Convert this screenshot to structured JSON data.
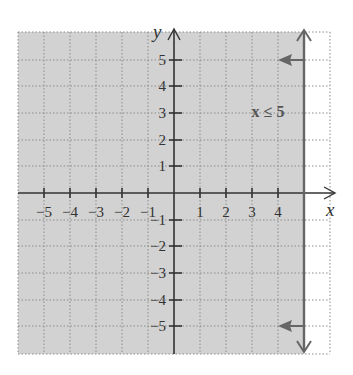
{
  "figure": {
    "type": "coordinate-plane-inequality-graph",
    "inequality_label": "x ≤ 5",
    "x_axis_label": "x",
    "y_axis_label": "y",
    "x_tick_labels": [
      "−5",
      "−4",
      "−3",
      "−2",
      "−1",
      "1",
      "2",
      "3",
      "4"
    ],
    "y_tick_labels": [
      "5",
      "4",
      "3",
      "2",
      "1",
      "−1",
      "−2",
      "−3",
      "−4",
      "−5"
    ],
    "x_range": [
      -6,
      6
    ],
    "y_range": [
      -6,
      6
    ],
    "boundary_line": "x = 5",
    "shaded_region": "left of x = 5",
    "colors": {
      "shade": "#d2d2d2",
      "boundary_line": "#666666",
      "axes": "#333333",
      "grid": "#999999"
    }
  }
}
